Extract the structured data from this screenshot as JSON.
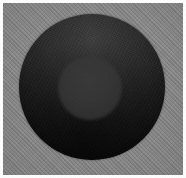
{
  "image": {
    "title": "Dark sphere on textured gray background",
    "width": 186,
    "height": 178,
    "background": {
      "color": "#8b8b8b",
      "border_color": "#fdfdfd",
      "texture": "diagonal-stripe-weave",
      "texture_angle_deg": 45
    },
    "subject": {
      "name": "dark-sphere",
      "shape": "circle",
      "center_x": 92,
      "center_y": 87,
      "radius": 73,
      "highlight_color": "#3c3c3c",
      "shadow_color": "#050505",
      "light_direction": "top"
    },
    "inner_feature": {
      "name": "inner-disc",
      "shape": "circle",
      "center_x": 90,
      "center_y": 88,
      "radius": 32,
      "color": "#363636",
      "edge": "soft"
    }
  }
}
